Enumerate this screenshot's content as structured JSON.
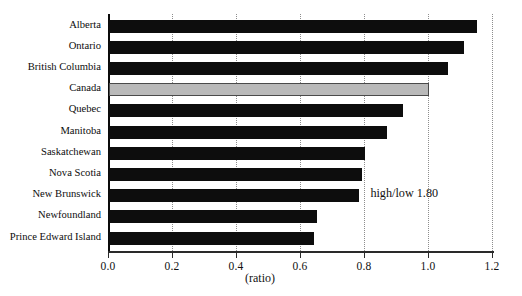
{
  "chart_data": {
    "type": "bar",
    "orientation": "horizontal",
    "title": "",
    "xlabel": "(ratio)",
    "ylabel": "",
    "xlim": [
      0.0,
      1.2
    ],
    "xticks": [
      "0.0",
      "0.2",
      "0.4",
      "0.6",
      "0.8",
      "1.0",
      "1.2"
    ],
    "xtick_values": [
      0.0,
      0.2,
      0.4,
      0.6,
      0.8,
      1.0,
      1.2
    ],
    "grid": "vertical dotted gridlines at each tick",
    "legend": "none",
    "categories": [
      "Alberta",
      "Ontario",
      "British Columbia",
      "Canada",
      "Quebec",
      "Manitoba",
      "Saskatchewan",
      "Nova Scotia",
      "New Brunswick",
      "Newfoundland",
      "Prince Edward Island"
    ],
    "values": [
      1.15,
      1.11,
      1.06,
      1.0,
      0.92,
      0.87,
      0.8,
      0.79,
      0.78,
      0.65,
      0.64
    ],
    "highlight_category": "Canada",
    "annotations": [
      {
        "text": "high/low 1.80",
        "x": 0.82,
        "y_category": "New Brunswick"
      }
    ],
    "colors": {
      "bar": "#0d0d0d",
      "highlight_bar": "#b9b9b9",
      "highlight_border": "#4a4a4a",
      "axis": "#2a2a2a",
      "gridline": "#8d8d8d",
      "text": "#111111",
      "background": "#ffffff"
    }
  }
}
